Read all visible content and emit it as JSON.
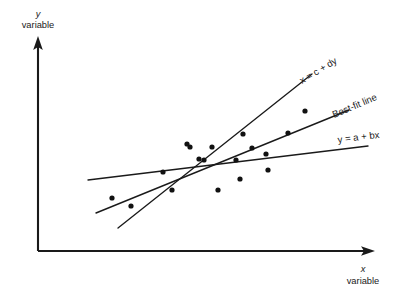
{
  "chart_data": {
    "type": "scatter",
    "title": "",
    "subtitle": "",
    "xlabel_symbol": "x",
    "xlabel_word": "variable",
    "ylabel_symbol": "y",
    "ylabel_word": "variable",
    "grid": false,
    "legend_position": "inline-line-labels",
    "axis_ranges": {
      "xlim": [
        0,
        100
      ],
      "ylim": [
        0,
        100
      ]
    },
    "axis_ticks": {
      "x": [],
      "y": []
    },
    "points_note": "18 scatter points in pixel coordinates of the 412x294 figure",
    "points": [
      {
        "x": 112,
        "y": 198
      },
      {
        "x": 163,
        "y": 172
      },
      {
        "x": 187,
        "y": 144
      },
      {
        "x": 131,
        "y": 206
      },
      {
        "x": 172,
        "y": 190
      },
      {
        "x": 190,
        "y": 147
      },
      {
        "x": 199,
        "y": 159
      },
      {
        "x": 212,
        "y": 147
      },
      {
        "x": 204,
        "y": 160
      },
      {
        "x": 236,
        "y": 160
      },
      {
        "x": 218,
        "y": 190
      },
      {
        "x": 240,
        "y": 179
      },
      {
        "x": 268,
        "y": 170
      },
      {
        "x": 243,
        "y": 134
      },
      {
        "x": 266,
        "y": 154
      },
      {
        "x": 288,
        "y": 133
      },
      {
        "x": 305,
        "y": 111
      },
      {
        "x": 252,
        "y": 148
      }
    ],
    "lines": [
      {
        "name": "x = c + dy",
        "label": "x = c + dy",
        "description": "regression of x on y, steepest slope",
        "x1": 118,
        "y1": 228,
        "x2": 312,
        "y2": 74
      },
      {
        "name": "Best-fit line",
        "label": "Best-fit line",
        "description": "major-axis best fit, intermediate slope",
        "x1": 96,
        "y1": 213,
        "x2": 349,
        "y2": 110
      },
      {
        "name": "y = a + bx",
        "label": "y = a + bx",
        "description": "regression of y on x, shallowest slope",
        "x1": 88,
        "y1": 180,
        "x2": 368,
        "y2": 146
      }
    ],
    "centroid": {
      "x": 232,
      "y": 167
    }
  },
  "figure": {
    "axes": {
      "y_axis": {
        "x": 38,
        "y_top": 38,
        "y_bottom": 251
      },
      "x_axis": {
        "y": 251,
        "x_left": 38,
        "x_right": 374
      }
    },
    "labels": {
      "y_symbol": "y",
      "y_word": "variable",
      "x_symbol": "x",
      "x_word": "variable",
      "line_top": "x = c + dy",
      "line_mid": "Best-fit line",
      "line_bottom": "y = a + bx"
    },
    "colors": {
      "ink": "#1a1a1a",
      "point": "#111111",
      "background": "#ffffff"
    }
  }
}
